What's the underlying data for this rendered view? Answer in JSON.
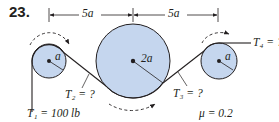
{
  "problem": {
    "number": "23.",
    "dimensions": [
      {
        "label": "5a",
        "from": "left pulley center",
        "to": "center pulley center"
      },
      {
        "label": "5a",
        "from": "center pulley center",
        "to": "right pulley center"
      }
    ],
    "pulleys": [
      {
        "name": "left",
        "radius_label": "a"
      },
      {
        "name": "center",
        "radius_label": "2a"
      },
      {
        "name": "right",
        "radius_label": "a"
      }
    ],
    "tensions": {
      "T1": "T₁ = 100 lb",
      "T2": "T₂ = ?",
      "T3": "T₃ = ?",
      "T4": "T₄ = ?"
    },
    "friction": "μ = 0.2"
  },
  "colors": {
    "pulley_fill": "#c5d6ee",
    "stroke": "#231f20"
  }
}
